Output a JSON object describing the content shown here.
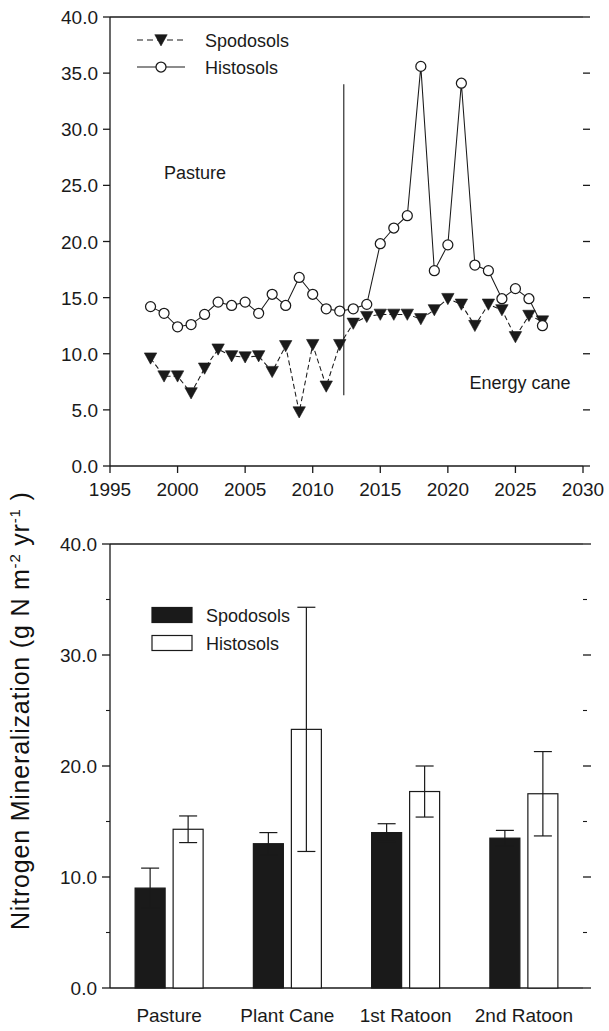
{
  "figure": {
    "y_axis_title_main": "Nitrogen Mineralization (g N m",
    "y_axis_title_sup1": "-2",
    "y_axis_title_mid": " yr",
    "y_axis_title_sup2": "-1",
    "y_axis_title_end": " )",
    "y_axis_title_full": "Nitrogen Mineralization (g N m-2 yr-1 )",
    "line_color": "#1a1a1a",
    "fill_dark": "#1a1a1a",
    "fill_light": "#ffffff"
  },
  "chart_data": [
    {
      "type": "line",
      "id": "timeseries",
      "title": "",
      "xlabel": "",
      "ylabel": "Nitrogen Mineralization (g N m-2 yr-1 )",
      "xlim": [
        1995,
        2030
      ],
      "ylim": [
        0.0,
        40.0
      ],
      "xticks": [
        1995,
        2000,
        2005,
        2010,
        2015,
        2020,
        2025,
        2030
      ],
      "xtick_labels": [
        "1995",
        "2000",
        "2005",
        "2010",
        "2015",
        "2020",
        "2025",
        "2030"
      ],
      "yticks": [
        0.0,
        5.0,
        10.0,
        15.0,
        20.0,
        25.0,
        30.0,
        35.0,
        40.0
      ],
      "ytick_labels": [
        "0.0",
        "5.0",
        "10.0",
        "15.0",
        "20.0",
        "25.0",
        "30.0",
        "35.0",
        "40.0"
      ],
      "grid": false,
      "legend_position": "top-left",
      "annotations": [
        {
          "text": "Pasture",
          "x": 1999.0,
          "y": 25.6
        },
        {
          "text": "Energy cane",
          "x": 2021.6,
          "y": 6.9
        }
      ],
      "vline": {
        "x": 2012.3,
        "y_bottom": 6.3,
        "y_top": 34.0
      },
      "x": [
        1998,
        1999,
        2000,
        2001,
        2002,
        2003,
        2004,
        2005,
        2006,
        2007,
        2008,
        2009,
        2010,
        2011,
        2012,
        2013,
        2014,
        2015,
        2016,
        2017,
        2018,
        2019,
        2020,
        2021,
        2022,
        2023,
        2024,
        2025,
        2026,
        2027
      ],
      "series": [
        {
          "name": "Spodosols",
          "marker": "filled-triangle-down",
          "linestyle": "dashed",
          "values": [
            9.6,
            8.0,
            8.0,
            6.5,
            8.7,
            10.4,
            9.8,
            9.7,
            9.8,
            8.4,
            10.7,
            4.8,
            10.8,
            7.1,
            10.8,
            12.7,
            13.3,
            13.5,
            13.5,
            13.5,
            13.1,
            13.9,
            14.9,
            14.4,
            12.5,
            14.4,
            13.9,
            11.5,
            13.4,
            12.9
          ]
        },
        {
          "name": "Histosols",
          "marker": "open-circle",
          "linestyle": "solid",
          "values": [
            14.2,
            13.6,
            12.4,
            12.6,
            13.5,
            14.6,
            14.3,
            14.6,
            13.6,
            15.3,
            14.3,
            16.8,
            15.3,
            14.0,
            13.8,
            14.0,
            14.4,
            19.8,
            21.2,
            22.3,
            35.6,
            17.4,
            19.7,
            34.1,
            17.9,
            17.4,
            14.9,
            15.8,
            14.9,
            12.5,
            14.8,
            13.1
          ]
        }
      ]
    },
    {
      "type": "bar",
      "id": "barchart",
      "title": "",
      "xlabel": "",
      "ylabel": "Nitrogen Mineralization (g N m-2 yr-1 )",
      "ylim": [
        0.0,
        40.0
      ],
      "yticks": [
        0.0,
        10.0,
        20.0,
        30.0,
        40.0
      ],
      "ytick_labels": [
        "0.0",
        "10.0",
        "20.0",
        "30.0",
        "40.0"
      ],
      "minor_yticks": [
        5.0,
        15.0,
        25.0,
        35.0
      ],
      "grid": false,
      "legend_position": "top-left",
      "categories": [
        "Pasture",
        "Plant Cane",
        "1st Ratoon",
        "2nd Ratoon"
      ],
      "series": [
        {
          "name": "Spodosols",
          "fill": "#1a1a1a",
          "values": [
            9.0,
            13.0,
            14.0,
            13.5
          ],
          "errors": [
            1.8,
            1.0,
            0.8,
            0.7
          ]
        },
        {
          "name": "Histosols",
          "fill": "#ffffff",
          "values": [
            14.3,
            23.3,
            17.7,
            17.5
          ],
          "errors": [
            1.2,
            11.0,
            2.3,
            3.8
          ]
        }
      ]
    }
  ],
  "top_chart": {
    "legend": [
      {
        "label": "Spodosols",
        "marker": "filled-triangle-down",
        "linestyle": "dashed"
      },
      {
        "label": "Histosols",
        "marker": "open-circle",
        "linestyle": "solid"
      }
    ],
    "annotation_pasture": "Pasture",
    "annotation_energy_cane": "Energy cane"
  },
  "bottom_chart": {
    "legend": [
      {
        "label": "Spodosols",
        "swatch": "filled"
      },
      {
        "label": "Histosols",
        "swatch": "open"
      }
    ]
  }
}
